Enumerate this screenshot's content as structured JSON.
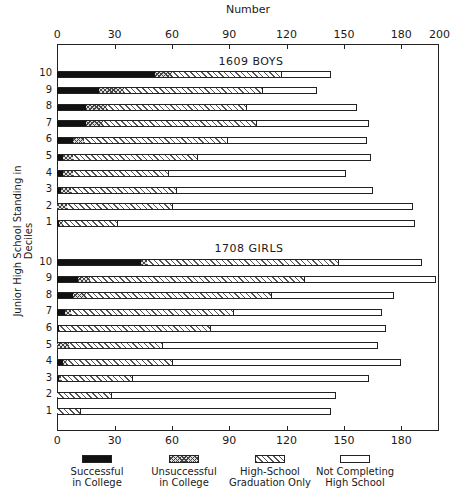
{
  "chart_data": {
    "type": "bar",
    "orientation": "horizontal",
    "stacked": true,
    "title": "",
    "xlabel": "Number",
    "ylabel": "Junior High School Standing in Deciles",
    "xlim": [
      0,
      200
    ],
    "top_ticks": [
      "0",
      "30",
      "60",
      "90",
      "120",
      "150",
      "180",
      "200"
    ],
    "bottom_ticks": [
      "0",
      "30",
      "60",
      "90",
      "120",
      "150",
      "180"
    ],
    "grid": false,
    "legend_position": "bottom",
    "legend": [
      {
        "key": "s",
        "label": "Successful\nin College",
        "pattern": "solid-black"
      },
      {
        "key": "u",
        "label": "Unsuccessful\nin College",
        "pattern": "crosshatch"
      },
      {
        "key": "h",
        "label": "High-School\nGraduation Only",
        "pattern": "diagonal-hatch"
      },
      {
        "key": "n",
        "label": "Not Completing\nHigh School",
        "pattern": "blank"
      }
    ],
    "groups": [
      {
        "title": "1609 BOYS",
        "categories": [
          "10",
          "9",
          "8",
          "7",
          "6",
          "5",
          "4",
          "3",
          "2",
          "1"
        ],
        "series": [
          {
            "name": "Successful in College",
            "values": [
              51,
              22,
              15,
              15,
              8,
              3,
              3,
              2,
              0,
              1
            ]
          },
          {
            "name": "Unsuccessful in College",
            "values": [
              9,
              13,
              11,
              9,
              6,
              5,
              5,
              5,
              5,
              2
            ]
          },
          {
            "name": "High-School Graduation Only",
            "values": [
              57,
              72,
              73,
              80,
              75,
              65,
              50,
              55,
              55,
              28
            ]
          },
          {
            "name": "Not Completing High School",
            "values": [
              26,
              29,
              58,
              59,
              73,
              91,
              93,
              103,
              126,
              156
            ]
          }
        ]
      },
      {
        "title": "1708 GIRLS",
        "categories": [
          "10",
          "9",
          "8",
          "7",
          "6",
          "5",
          "4",
          "3",
          "2",
          "1"
        ],
        "series": [
          {
            "name": "Successful in College",
            "values": [
              44,
              11,
              8,
              4,
              1,
              0,
              3,
              1,
              0,
              0
            ]
          },
          {
            "name": "Unsuccessful in College",
            "values": [
              3,
              6,
              7,
              3,
              0,
              6,
              2,
              1,
              0,
              0
            ]
          },
          {
            "name": "High-School Graduation Only",
            "values": [
              100,
              112,
              97,
              85,
              79,
              49,
              55,
              37,
              28,
              12
            ]
          },
          {
            "name": "Not Completing High School",
            "values": [
              44,
              69,
              64,
              78,
              92,
              113,
              120,
              124,
              118,
              131
            ]
          }
        ]
      }
    ]
  },
  "labels": {
    "x_axis_title": "Number",
    "y_axis_title": "Junior High School Standing in Deciles",
    "boys_title": "1609 BOYS",
    "girls_title": "1708 GIRLS"
  }
}
